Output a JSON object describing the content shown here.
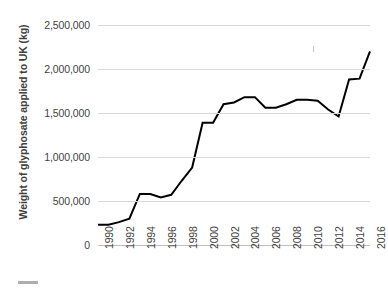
{
  "chart_data": {
    "type": "line",
    "title": "",
    "xlabel": "",
    "ylabel": "Weight of glyphosate applied to UK (kg)",
    "x": [
      1990,
      1991,
      1992,
      1993,
      1994,
      1995,
      1996,
      1997,
      1998,
      1999,
      2000,
      2001,
      2002,
      2003,
      2004,
      2005,
      2006,
      2007,
      2008,
      2009,
      2010,
      2011,
      2012,
      2013,
      2014,
      2015,
      2016
    ],
    "values": [
      230000,
      230000,
      260000,
      300000,
      580000,
      580000,
      540000,
      570000,
      730000,
      880000,
      1390000,
      1390000,
      1600000,
      1620000,
      1680000,
      1680000,
      1560000,
      1560000,
      1600000,
      1650000,
      1650000,
      1640000,
      1540000,
      1460000,
      1880000,
      1890000,
      2200000
    ],
    "series": [
      {
        "name": "Weight of glyphosate applied to UK (kg)",
        "color": "#000000",
        "values": [
          230000,
          230000,
          260000,
          300000,
          580000,
          580000,
          540000,
          570000,
          730000,
          880000,
          1390000,
          1390000,
          1600000,
          1620000,
          1680000,
          1680000,
          1560000,
          1560000,
          1600000,
          1650000,
          1650000,
          1640000,
          1540000,
          1460000,
          1880000,
          1890000,
          2200000
        ]
      }
    ],
    "ylim": [
      0,
      2500000
    ],
    "xlim": [
      1990,
      2016
    ],
    "y_ticks": [
      0,
      500000,
      1000000,
      1500000,
      2000000,
      2500000
    ],
    "y_tick_labels": [
      "0",
      "500,000",
      "1,000,000",
      "1,500,000",
      "2,000,000",
      "2,500,000"
    ],
    "x_ticks": [
      1990,
      1992,
      1994,
      1996,
      1998,
      2000,
      2002,
      2004,
      2006,
      2008,
      2010,
      2012,
      2014,
      2016
    ],
    "x_tick_labels": [
      "1990",
      "1992",
      "1994",
      "1996",
      "1998",
      "2000",
      "2002",
      "2004",
      "2006",
      "2008",
      "2010",
      "2012",
      "2014",
      "2016"
    ],
    "grid": true,
    "grid_color": "#d9d9d9",
    "legend": false,
    "legend_position": "none",
    "line_width": 2,
    "annotations": []
  }
}
